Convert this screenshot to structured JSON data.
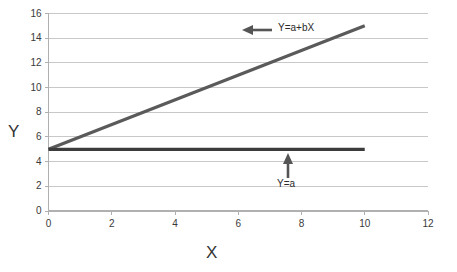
{
  "chart_data": {
    "type": "line",
    "title": "",
    "subtitle": "",
    "xlabel": "X",
    "ylabel": "Y",
    "xlim": [
      0,
      12
    ],
    "ylim": [
      0,
      16
    ],
    "xticks": [
      "0",
      "2",
      "4",
      "6",
      "8",
      "10",
      "12"
    ],
    "xtick_values": [
      0,
      2,
      4,
      6,
      8,
      10,
      12
    ],
    "yticks": [
      "0",
      "2",
      "4",
      "6",
      "8",
      "10",
      "12",
      "14",
      "16"
    ],
    "ytick_values": [
      0,
      2,
      4,
      6,
      8,
      10,
      12,
      14,
      16
    ],
    "grid": "horizontal",
    "legend": "none",
    "series": [
      {
        "name": "Y=a+bX",
        "x": [
          0,
          10
        ],
        "values": [
          5,
          15
        ],
        "color": "#5a5a5a",
        "intercept": 5,
        "slope": 1
      },
      {
        "name": "Y=a",
        "x": [
          0,
          10
        ],
        "values": [
          5,
          5
        ],
        "color": "#3c3c3c",
        "intercept": 5,
        "slope": 0
      }
    ],
    "annotations": [
      {
        "text": "Y=a+bX",
        "arrow": "left-arrow",
        "x": 7.2,
        "y": 14.6
      },
      {
        "text": "Y=a",
        "arrow": "up-arrow",
        "x": 7.4,
        "y": 2.9
      }
    ]
  },
  "axes": {
    "y_axis_label": "Y",
    "x_axis_label": "X"
  },
  "colors": {
    "slope_line": "#5a5a5a",
    "flat_line": "#3c3c3c",
    "grid": "#c8c8c8",
    "axis": "#b0b0b0",
    "text": "#3a3a3a",
    "background": "#ffffff"
  }
}
